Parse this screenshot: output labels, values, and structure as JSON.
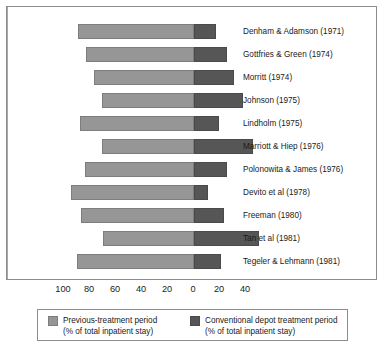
{
  "chart_data": {
    "type": "bar",
    "orientation": "horizontal",
    "stacked": "diverging",
    "title": "",
    "subtitle": "",
    "xlabel": "",
    "ylabel": "",
    "grid": false,
    "zero_line": true,
    "xlim": [
      -100,
      55
    ],
    "axis_ticks": [
      {
        "label": "100",
        "value": -100
      },
      {
        "label": "80",
        "value": -80
      },
      {
        "label": "60",
        "value": -60
      },
      {
        "label": "40",
        "value": -40
      },
      {
        "label": "20",
        "value": -20
      },
      {
        "label": "0",
        "value": 0
      },
      {
        "label": "20",
        "value": 20
      },
      {
        "label": "40",
        "value": 40
      }
    ],
    "categories": [
      "Denham & Adamson (1971)",
      "Gottfries & Green (1974)",
      "Morritt (1974)",
      "Johnson (1975)",
      "Lindholm (1975)",
      "Marriott & Hiep (1976)",
      "Polonowita & James (1976)",
      "Devito et al (1978)",
      "Freeman (1980)",
      "Tan et al (1981)",
      "Tegeler & Lehmann (1981)"
    ],
    "series": [
      {
        "name": "Previous-treatment period (% of total inpatient stay)",
        "color": "#969696",
        "values": [
          89,
          83,
          77,
          71,
          88,
          71,
          84,
          95,
          87,
          70,
          90
        ]
      },
      {
        "name": "Conventional depot treatment period (% of total inpatient stay)",
        "color": "#565656",
        "values": [
          17,
          25,
          31,
          38,
          19,
          45,
          25,
          11,
          23,
          50,
          21
        ]
      }
    ],
    "legend_position": "bottom"
  },
  "chart": {
    "rows": [
      {
        "label": "Denham & Adamson (1971)",
        "prev": 89,
        "conv": 17
      },
      {
        "label": "Gottfries & Green (1974)",
        "prev": 83,
        "conv": 25
      },
      {
        "label": "Morritt (1974)",
        "prev": 77,
        "conv": 31
      },
      {
        "label": "Johnson (1975)",
        "prev": 71,
        "conv": 38
      },
      {
        "label": "Lindholm (1975)",
        "prev": 88,
        "conv": 19
      },
      {
        "label": "Marriott & Hiep (1976)",
        "prev": 71,
        "conv": 45
      },
      {
        "label": "Polonowita & James (1976)",
        "prev": 84,
        "conv": 25
      },
      {
        "label": "Devito et al (1978)",
        "prev": 95,
        "conv": 11
      },
      {
        "label": "Freeman (1980)",
        "prev": 87,
        "conv": 23
      },
      {
        "label": "Tan et al (1981)",
        "prev": 70,
        "conv": 50
      },
      {
        "label": "Tegeler & Lehmann (1981)",
        "prev": 90,
        "conv": 21
      }
    ],
    "ticks": [
      "100",
      "80",
      "60",
      "40",
      "20",
      "0",
      "20",
      "40"
    ],
    "tick_values": [
      -100,
      -80,
      -60,
      -40,
      -20,
      0,
      20,
      40
    ]
  },
  "legend": {
    "items": [
      {
        "swatch": "prev",
        "line1": "Previous-treatment period",
        "line2": "(% of total inpatient stay)"
      },
      {
        "swatch": "conv",
        "line1": "Conventional depot treatment period",
        "line2": "(% of total inpatient stay)"
      }
    ]
  },
  "colors": {
    "previous_treatment": "#969696",
    "conventional_depot": "#565656",
    "frame": "#8c8c8c",
    "zero_line": "#a8a8a8",
    "text": "#1a1a1a",
    "background": "#ffffff"
  }
}
